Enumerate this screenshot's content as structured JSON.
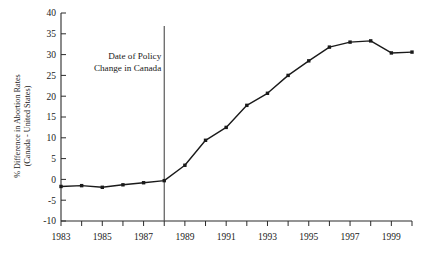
{
  "chart_data": {
    "type": "line",
    "title": "",
    "subtitle": "",
    "xlabel": "",
    "ylabel": "% Difference in Abortion Rates (Canada - United States)",
    "ylabel_line1": "% Difference in Abortion Rates",
    "ylabel_line2": "(Canada - United States)",
    "x": [
      1983,
      1984,
      1985,
      1986,
      1987,
      1988,
      1989,
      1990,
      1991,
      1992,
      1993,
      1994,
      1995,
      1996,
      1997,
      1998,
      1999,
      2000
    ],
    "values": [
      -1.7,
      -1.5,
      -1.9,
      -1.3,
      -0.8,
      -0.3,
      3.4,
      9.4,
      12.5,
      17.8,
      20.7,
      25.0,
      28.5,
      31.8,
      33.0,
      33.3,
      30.4,
      30.6
    ],
    "series": [
      {
        "name": "% Difference in Abortion Rates (Canada - United States)",
        "values": [
          -1.7,
          -1.5,
          -1.9,
          -1.3,
          -0.8,
          -0.3,
          3.4,
          9.4,
          12.5,
          17.8,
          20.7,
          25.0,
          28.5,
          31.8,
          33.0,
          33.3,
          30.4,
          30.6
        ]
      }
    ],
    "xlim": [
      1983,
      2000
    ],
    "ylim": [
      -10,
      40
    ],
    "yticks": [
      -10,
      -5,
      0,
      5,
      10,
      15,
      20,
      25,
      30,
      35,
      40
    ],
    "ytick_labels": [
      "-10",
      "-5",
      "0",
      "5",
      "10",
      "15",
      "20",
      "25",
      "30",
      "35",
      "40"
    ],
    "xticks": [
      1983,
      1984,
      1985,
      1986,
      1987,
      1988,
      1989,
      1990,
      1991,
      1992,
      1993,
      1994,
      1995,
      1996,
      1997,
      1998,
      1999,
      2000
    ],
    "xtick_labels_shown": [
      "1983",
      "1985",
      "1987",
      "1989",
      "1991",
      "1993",
      "1995",
      "1997",
      "1999"
    ],
    "xtick_labeled_values": [
      1983,
      1985,
      1987,
      1989,
      1991,
      1993,
      1995,
      1997,
      1999
    ],
    "grid": false,
    "legend": false,
    "legend_position": "none",
    "marker": "square",
    "line_color": "#1a1a1a",
    "marker_color": "#1a1a1a",
    "axis_color": "#2b2b2b",
    "background_color": "#ffffff",
    "annotations": [
      {
        "name": "policy-change-marker",
        "kind": "vertical-line",
        "x": 1988,
        "color": "#4a4a4a",
        "label_line1": "Date of Policy",
        "label_line2": "Change in Canada",
        "label_text": "Date of Policy Change in Canada",
        "label_align": "right"
      }
    ]
  }
}
